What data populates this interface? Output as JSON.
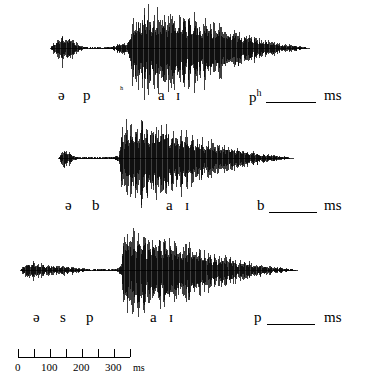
{
  "figure": {
    "type": "speech-waveform-panels",
    "ink_color": "#000000",
    "background_color": "#ffffff",
    "width": 373,
    "height": 385
  },
  "panels": [
    {
      "id": "panel-1",
      "baseline_y": 48,
      "segments": [
        {
          "name": "schwa",
          "label": "ə",
          "x": 62,
          "start_px": 50,
          "end_px": 80
        },
        {
          "name": "p-closure",
          "label": "p",
          "x": 85
        },
        {
          "name": "aspiration",
          "label": "ʰ",
          "x": 122,
          "superscript": true
        },
        {
          "name": "vowel-a",
          "label": "a",
          "x": 160
        },
        {
          "name": "vowel-i",
          "label": "ɪ",
          "x": 177
        },
        {
          "name": "final-p-aspirated",
          "label": "p",
          "sup": "h",
          "x": 250
        }
      ],
      "blank": {
        "x": 266,
        "width": 50,
        "y": 100
      },
      "unit": "ms",
      "unit_x": 327
    },
    {
      "id": "panel-2",
      "baseline_y": 158,
      "segments": [
        {
          "name": "schwa",
          "label": "ə",
          "x": 68
        },
        {
          "name": "b-closure",
          "label": "b",
          "x": 95
        },
        {
          "name": "vowel-a",
          "label": "a",
          "x": 168
        },
        {
          "name": "vowel-i",
          "label": "ɪ",
          "x": 186
        },
        {
          "name": "final-b",
          "label": "b",
          "x": 258
        }
      ],
      "blank": {
        "x": 270,
        "width": 48,
        "y": 210
      },
      "unit": "ms",
      "unit_x": 327
    },
    {
      "id": "panel-3",
      "baseline_y": 270,
      "segments": [
        {
          "name": "schwa",
          "label": "ə",
          "x": 36
        },
        {
          "name": "s-fricative",
          "label": "s",
          "x": 62
        },
        {
          "name": "p-closure",
          "label": "p",
          "x": 88
        },
        {
          "name": "vowel-a",
          "label": "a",
          "x": 152
        },
        {
          "name": "vowel-i",
          "label": "ɪ",
          "x": 170
        },
        {
          "name": "final-p",
          "label": "p",
          "x": 255
        }
      ],
      "blank": {
        "x": 268,
        "width": 48,
        "y": 330
      },
      "unit": "ms",
      "unit_x": 327
    }
  ],
  "axis": {
    "name": "time-axis",
    "orientation": "horizontal",
    "x_start": 18,
    "x_end": 130,
    "y": 355,
    "unit": "ms",
    "unit_x": 108,
    "tick_count": 8,
    "tick_step_ms": 50,
    "ticks": [
      {
        "value": 0,
        "label": "0",
        "x": 18
      },
      {
        "value": 50,
        "label": "",
        "x": 34
      },
      {
        "value": 100,
        "label": "100",
        "x": 50
      },
      {
        "value": 150,
        "label": "",
        "x": 66
      },
      {
        "value": 200,
        "label": "200",
        "x": 82
      },
      {
        "value": 250,
        "label": "",
        "x": 98
      },
      {
        "value": 300,
        "label": "300",
        "x": 114
      },
      {
        "value": 350,
        "label": "",
        "x": 130
      }
    ]
  },
  "chart_data": {
    "type": "line",
    "title": "",
    "xlabel": "ms",
    "ylabel": "",
    "grid": false,
    "legend": "none",
    "xlim": [
      0,
      373
    ],
    "series": [
      {
        "name": "əpʰaɪpʰ",
        "baseline_y": 48,
        "envelope_points": [
          [
            50,
            0
          ],
          [
            54,
            7
          ],
          [
            58,
            12
          ],
          [
            62,
            16
          ],
          [
            66,
            13
          ],
          [
            70,
            15
          ],
          [
            74,
            9
          ],
          [
            78,
            5
          ],
          [
            82,
            2
          ],
          [
            86,
            1
          ],
          [
            100,
            1
          ],
          [
            112,
            1
          ],
          [
            116,
            4
          ],
          [
            120,
            6
          ],
          [
            124,
            7
          ],
          [
            127,
            5
          ],
          [
            129,
            10
          ],
          [
            131,
            30
          ],
          [
            133,
            40
          ],
          [
            135,
            36
          ],
          [
            138,
            44
          ],
          [
            141,
            41
          ],
          [
            144,
            46
          ],
          [
            147,
            43
          ],
          [
            150,
            45
          ],
          [
            153,
            42
          ],
          [
            157,
            44
          ],
          [
            161,
            40
          ],
          [
            165,
            43
          ],
          [
            169,
            39
          ],
          [
            173,
            41
          ],
          [
            177,
            38
          ],
          [
            181,
            40
          ],
          [
            185,
            37
          ],
          [
            189,
            38
          ],
          [
            193,
            35
          ],
          [
            197,
            36
          ],
          [
            201,
            33
          ],
          [
            205,
            34
          ],
          [
            209,
            31
          ],
          [
            213,
            30
          ],
          [
            218,
            28
          ],
          [
            223,
            26
          ],
          [
            228,
            24
          ],
          [
            233,
            22
          ],
          [
            238,
            20
          ],
          [
            243,
            18
          ],
          [
            248,
            16
          ],
          [
            253,
            14
          ],
          [
            258,
            12
          ],
          [
            264,
            10
          ],
          [
            270,
            8
          ],
          [
            276,
            7
          ],
          [
            282,
            5
          ],
          [
            288,
            4
          ],
          [
            294,
            3
          ],
          [
            300,
            2
          ],
          [
            305,
            1
          ],
          [
            310,
            0
          ]
        ]
      },
      {
        "name": "əbaɪb",
        "baseline_y": 158,
        "envelope_points": [
          [
            58,
            0
          ],
          [
            61,
            5
          ],
          [
            64,
            11
          ],
          [
            66,
            7
          ],
          [
            69,
            9
          ],
          [
            72,
            4
          ],
          [
            75,
            2
          ],
          [
            80,
            1
          ],
          [
            95,
            1
          ],
          [
            110,
            1
          ],
          [
            116,
            2
          ],
          [
            119,
            5
          ],
          [
            121,
            28
          ],
          [
            123,
            42
          ],
          [
            126,
            38
          ],
          [
            129,
            44
          ],
          [
            132,
            40
          ],
          [
            135,
            43
          ],
          [
            138,
            39
          ],
          [
            141,
            42
          ],
          [
            145,
            38
          ],
          [
            149,
            40
          ],
          [
            153,
            36
          ],
          [
            157,
            38
          ],
          [
            161,
            34
          ],
          [
            165,
            36
          ],
          [
            169,
            32
          ],
          [
            173,
            34
          ],
          [
            177,
            30
          ],
          [
            181,
            32
          ],
          [
            185,
            28
          ],
          [
            190,
            27
          ],
          [
            195,
            25
          ],
          [
            200,
            23
          ],
          [
            205,
            21
          ],
          [
            210,
            20
          ],
          [
            215,
            18
          ],
          [
            220,
            17
          ],
          [
            225,
            15
          ],
          [
            230,
            14
          ],
          [
            235,
            12
          ],
          [
            240,
            11
          ],
          [
            246,
            9
          ],
          [
            252,
            8
          ],
          [
            258,
            6
          ],
          [
            264,
            5
          ],
          [
            270,
            4
          ],
          [
            276,
            3
          ],
          [
            282,
            2
          ],
          [
            288,
            1
          ],
          [
            294,
            0
          ]
        ]
      },
      {
        "name": "əspaɪp",
        "baseline_y": 270,
        "envelope_points": [
          [
            20,
            0
          ],
          [
            24,
            6
          ],
          [
            28,
            10
          ],
          [
            31,
            7
          ],
          [
            34,
            9
          ],
          [
            37,
            6
          ],
          [
            40,
            8
          ],
          [
            44,
            5
          ],
          [
            48,
            6
          ],
          [
            52,
            4
          ],
          [
            56,
            5
          ],
          [
            60,
            4
          ],
          [
            64,
            5
          ],
          [
            68,
            4
          ],
          [
            72,
            4
          ],
          [
            76,
            3
          ],
          [
            80,
            3
          ],
          [
            84,
            2
          ],
          [
            88,
            1
          ],
          [
            100,
            1
          ],
          [
            112,
            1
          ],
          [
            118,
            2
          ],
          [
            121,
            6
          ],
          [
            123,
            30
          ],
          [
            125,
            44
          ],
          [
            128,
            40
          ],
          [
            131,
            45
          ],
          [
            134,
            41
          ],
          [
            137,
            44
          ],
          [
            140,
            40
          ],
          [
            143,
            42
          ],
          [
            147,
            38
          ],
          [
            151,
            40
          ],
          [
            155,
            36
          ],
          [
            159,
            38
          ],
          [
            163,
            34
          ],
          [
            167,
            36
          ],
          [
            171,
            32
          ],
          [
            175,
            34
          ],
          [
            179,
            30
          ],
          [
            183,
            31
          ],
          [
            188,
            28
          ],
          [
            193,
            26
          ],
          [
            198,
            24
          ],
          [
            203,
            22
          ],
          [
            208,
            21
          ],
          [
            213,
            19
          ],
          [
            218,
            18
          ],
          [
            223,
            16
          ],
          [
            228,
            15
          ],
          [
            233,
            13
          ],
          [
            238,
            12
          ],
          [
            244,
            10
          ],
          [
            250,
            9
          ],
          [
            256,
            7
          ],
          [
            262,
            6
          ],
          [
            268,
            5
          ],
          [
            274,
            4
          ],
          [
            280,
            3
          ],
          [
            286,
            2
          ],
          [
            292,
            1
          ],
          [
            298,
            0
          ]
        ]
      }
    ]
  }
}
